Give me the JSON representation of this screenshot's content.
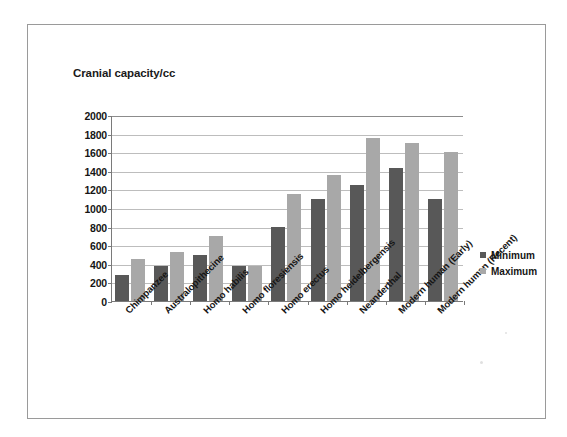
{
  "chart_data": {
    "type": "bar",
    "title": "Cranial capacity/cc",
    "xlabel": "",
    "ylabel": "Cranial capacity/cc",
    "ylim": [
      0,
      2000
    ],
    "ytick_step": 200,
    "yticks": [
      "2000",
      "1800",
      "1600",
      "1400",
      "1200",
      "1000",
      "800",
      "600",
      "400",
      "200",
      "0"
    ],
    "grid": true,
    "legend_position": "right",
    "categories": [
      "Chimpanzee",
      "Australopithecine",
      "Homo habilis",
      "Homo floresiensis",
      "Homo erectus",
      "Homo heidelbergensis",
      "Neanderthal",
      "Modern human (Early)",
      "Modern human (Recent)"
    ],
    "series": [
      {
        "name": "Minimum",
        "color": "#585858",
        "values": [
          275,
          375,
          500,
          380,
          800,
          1100,
          1250,
          1425,
          1100
        ]
      },
      {
        "name": "Maximum",
        "color": "#a8a8a8",
        "values": [
          450,
          525,
          700,
          380,
          1150,
          1350,
          1750,
          1700,
          1600
        ]
      }
    ]
  },
  "legend": {
    "items": [
      {
        "label": "Minimum"
      },
      {
        "label": "Maximum"
      }
    ]
  }
}
